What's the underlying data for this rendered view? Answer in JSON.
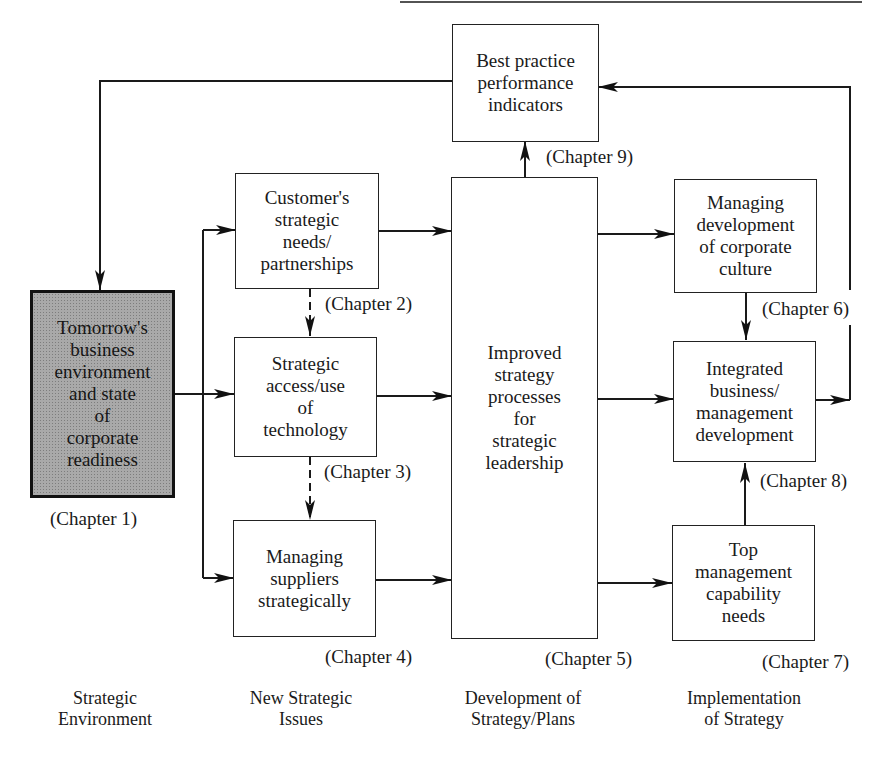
{
  "diagram": {
    "type": "flowchart",
    "top_rule": true,
    "nodes": {
      "best_practice": {
        "text": "Best practice\nperformance\nindicators",
        "chapter": "(Chapter 9)"
      },
      "tomorrow": {
        "text": "Tomorrow's\nbusiness\nenvironment\nand state\nof\ncorporate\nreadiness",
        "chapter": "(Chapter 1)",
        "shaded": true
      },
      "customer": {
        "text": "Customer's\nstrategic\nneeds/\npartnerships",
        "chapter": "(Chapter 2)"
      },
      "technology": {
        "text": "Strategic\naccess/use\nof\ntechnology",
        "chapter": "(Chapter 3)"
      },
      "suppliers": {
        "text": "Managing\nsuppliers\nstrategically",
        "chapter": "(Chapter 4)"
      },
      "improved": {
        "text": "Improved\nstrategy\nprocesses\nfor\nstrategic\nleadership",
        "chapter": "(Chapter 5)"
      },
      "culture": {
        "text": "Managing\ndevelopment\nof corporate\nculture",
        "chapter": "(Chapter 6)"
      },
      "integrated": {
        "text": "Integrated\nbusiness/\nmanagement\ndevelopment",
        "chapter": "(Chapter 8)"
      },
      "top_mgmt": {
        "text": "Top\nmanagement\ncapability\nneeds",
        "chapter": "(Chapter 7)"
      }
    },
    "edges": [
      {
        "from": "best_practice",
        "to": "tomorrow",
        "style": "solid"
      },
      {
        "from": "tomorrow",
        "to": "customer",
        "style": "solid"
      },
      {
        "from": "tomorrow",
        "to": "technology",
        "style": "solid"
      },
      {
        "from": "tomorrow",
        "to": "suppliers",
        "style": "solid"
      },
      {
        "from": "customer",
        "to": "technology",
        "style": "dashed"
      },
      {
        "from": "technology",
        "to": "suppliers",
        "style": "dashed"
      },
      {
        "from": "customer",
        "to": "improved",
        "style": "solid"
      },
      {
        "from": "technology",
        "to": "improved",
        "style": "solid"
      },
      {
        "from": "suppliers",
        "to": "improved",
        "style": "solid"
      },
      {
        "from": "improved",
        "to": "best_practice",
        "style": "solid"
      },
      {
        "from": "improved",
        "to": "culture",
        "style": "solid"
      },
      {
        "from": "improved",
        "to": "integrated",
        "style": "solid"
      },
      {
        "from": "improved",
        "to": "top_mgmt",
        "style": "solid"
      },
      {
        "from": "culture",
        "to": "integrated",
        "style": "solid"
      },
      {
        "from": "top_mgmt",
        "to": "integrated",
        "style": "solid"
      },
      {
        "from": "integrated",
        "to": "best_practice",
        "style": "solid"
      }
    ],
    "columns": [
      {
        "label": "Strategic\nEnvironment"
      },
      {
        "label": "New Strategic\nIssues"
      },
      {
        "label": "Development of\nStrategy/Plans"
      },
      {
        "label": "Implementation\nof Strategy"
      }
    ]
  }
}
